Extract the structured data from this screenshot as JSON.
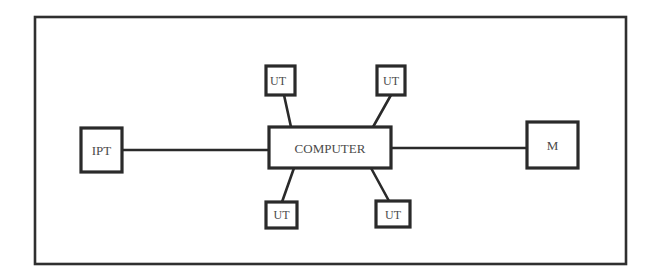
{
  "diagram": {
    "type": "star-topology",
    "nodes": {
      "computer": {
        "label": "COMPUTER"
      },
      "ipt": {
        "label": "IPT"
      },
      "m": {
        "label": "M"
      },
      "ut_top_left": {
        "label": "UT"
      },
      "ut_top_right": {
        "label": "UT"
      },
      "ut_bottom_left": {
        "label": "UT"
      },
      "ut_bottom_right": {
        "label": "UT"
      }
    },
    "edges": [
      {
        "from": "ipt",
        "to": "computer"
      },
      {
        "from": "computer",
        "to": "m"
      },
      {
        "from": "ut_top_left",
        "to": "computer"
      },
      {
        "from": "ut_top_right",
        "to": "computer"
      },
      {
        "from": "ut_bottom_left",
        "to": "computer"
      },
      {
        "from": "ut_bottom_right",
        "to": "computer"
      }
    ],
    "colors": {
      "stroke": "#2a2a2a",
      "text": "#4a4a4a",
      "background": "#ffffff"
    }
  }
}
